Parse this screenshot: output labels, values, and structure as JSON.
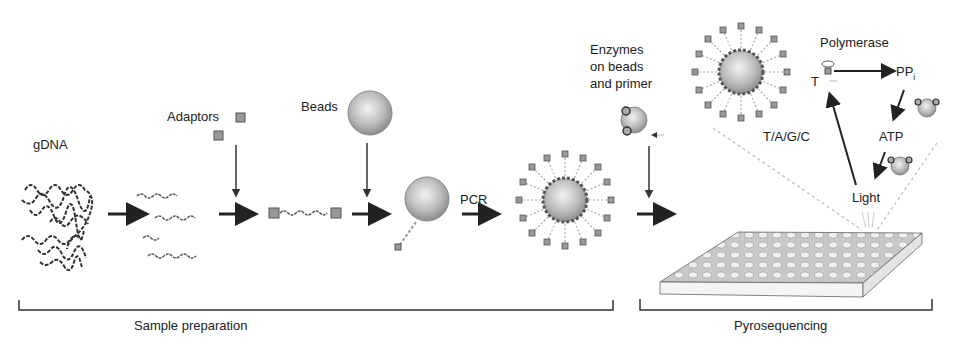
{
  "diagram": {
    "type": "workflow",
    "labels": {
      "gdna": "gDNA",
      "adaptors": "Adaptors",
      "beads": "Beads",
      "pcr": "PCR",
      "enzymes_line1": "Enzymes",
      "enzymes_line2": "on beads",
      "enzymes_line3": "and primer",
      "polymerase": "Polymerase",
      "t": "T",
      "pp": "PP",
      "pp_sub": "i",
      "atp": "ATP",
      "light": "Light",
      "nucleotides": "T/A/G/C"
    },
    "sections": [
      {
        "label": "Sample preparation"
      },
      {
        "label": "Pyrosequencing"
      }
    ],
    "colors": {
      "ink": "#222222",
      "bead": "#b8b8b8",
      "adaptor": "#8a8a8a",
      "plate": "#d0d0d0"
    }
  }
}
